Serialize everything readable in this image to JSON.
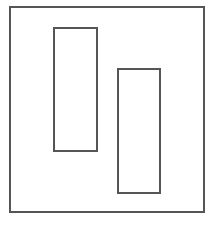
{
  "diagram": {
    "stroke_color": "#555555",
    "background": "#ffffff",
    "outer_frame": {
      "x": 9,
      "y": 6,
      "width": 196,
      "height": 207
    },
    "rectangles": [
      {
        "x": 53,
        "y": 27,
        "width": 45,
        "height": 125
      },
      {
        "x": 117,
        "y": 68,
        "width": 44,
        "height": 126
      }
    ]
  }
}
